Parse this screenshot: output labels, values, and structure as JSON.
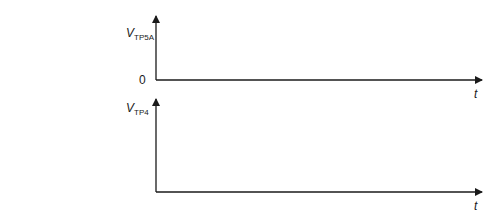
{
  "diagram": {
    "top_axis": {
      "y_label_main": "V",
      "y_label_sub": "TP5A",
      "zero_label": "0",
      "x_label": "t"
    },
    "bottom_axis": {
      "y_label_main": "V",
      "y_label_sub": "TP4",
      "x_label": "t"
    },
    "colors": {
      "axis": "#1a1a1a",
      "background": "#ffffff"
    }
  }
}
